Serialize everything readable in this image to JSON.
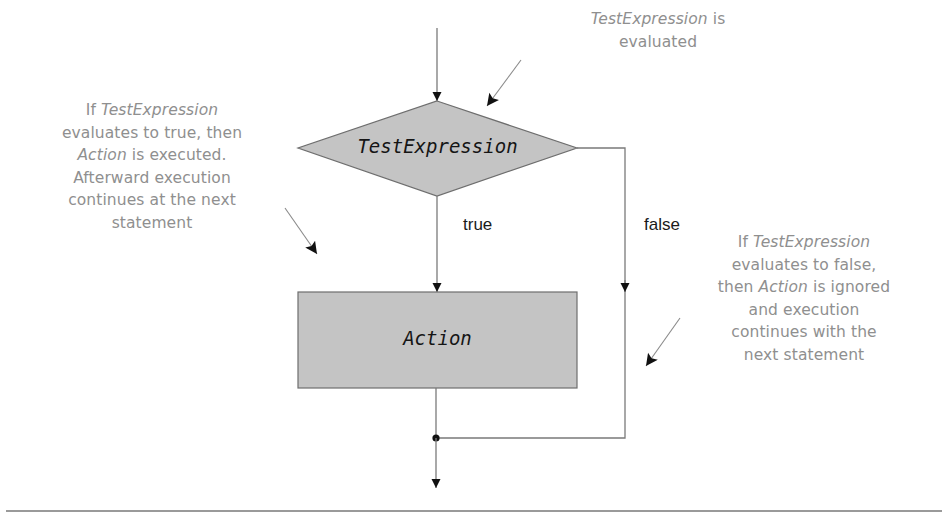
{
  "diagram": {
    "type": "flowchart",
    "nodes": {
      "decision": {
        "shape": "diamond",
        "label": "TestExpression"
      },
      "action": {
        "shape": "rectangle",
        "label": "Action"
      },
      "merge": {
        "shape": "junction-dot"
      }
    },
    "edges": {
      "true_label": "true",
      "false_label": "false"
    },
    "annotations": {
      "top": {
        "lines": [
          [
            {
              "text": "TestExpression",
              "italic": true
            },
            {
              "text": " is",
              "italic": false
            }
          ],
          [
            {
              "text": "evaluated",
              "italic": false
            }
          ]
        ]
      },
      "left": {
        "lines": [
          [
            {
              "text": "If ",
              "italic": false
            },
            {
              "text": "TestExpression",
              "italic": true
            }
          ],
          [
            {
              "text": "evaluates to true, then",
              "italic": false
            }
          ],
          [
            {
              "text": "Action",
              "italic": true
            },
            {
              "text": " is executed.",
              "italic": false
            }
          ],
          [
            {
              "text": "Afterward  execution",
              "italic": false
            }
          ],
          [
            {
              "text": "continues at the next",
              "italic": false
            }
          ],
          [
            {
              "text": "statement",
              "italic": false
            }
          ]
        ]
      },
      "right": {
        "lines": [
          [
            {
              "text": "If ",
              "italic": false
            },
            {
              "text": "TestExpression",
              "italic": true
            }
          ],
          [
            {
              "text": "evaluates to false,",
              "italic": false
            }
          ],
          [
            {
              "text": "then ",
              "italic": false
            },
            {
              "text": "Action",
              "italic": true
            },
            {
              "text": " is ignored",
              "italic": false
            }
          ],
          [
            {
              "text": "and execution",
              "italic": false
            }
          ],
          [
            {
              "text": "continues with the",
              "italic": false
            }
          ],
          [
            {
              "text": "next statement",
              "italic": false
            }
          ]
        ]
      }
    },
    "colors": {
      "shape_fill": "#c4c4c4",
      "shape_stroke": "#6e6e6e",
      "line": "#7a7a7a",
      "arrowhead": "#111111",
      "annotation_text": "#8f8f8f",
      "divider": "#9a9a9a"
    }
  }
}
